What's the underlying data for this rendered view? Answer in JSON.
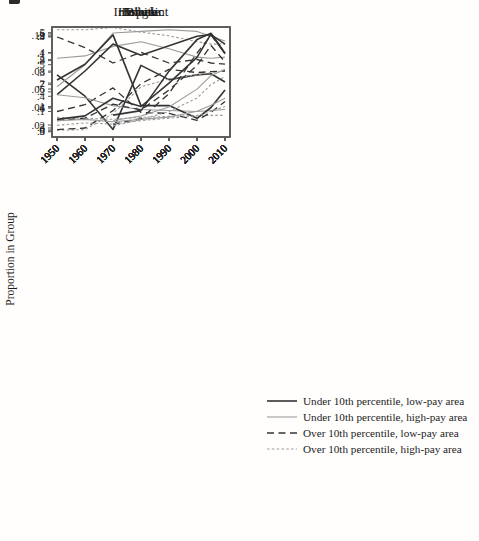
{
  "figure": {
    "ylabel": "Proportion in Group",
    "colors": {
      "dark": "#343434",
      "gray": "#9b9b9b",
      "axis": "#5a5a5a",
      "text": "#1c1c1c",
      "background": "#ffffff"
    },
    "line_styles": {
      "dark-solid": {
        "color": "dark",
        "width": 1.6,
        "dash": ""
      },
      "gray-solid": {
        "color": "gray",
        "width": 1.1,
        "dash": ""
      },
      "dark-dash": {
        "color": "dark",
        "width": 1.3,
        "dash": "7 4.5"
      },
      "gray-dash": {
        "color": "gray",
        "width": 1.1,
        "dash": "2.6 2.2"
      }
    }
  },
  "legend": {
    "items": [
      {
        "label": "Under 10th percentile, low-pay area",
        "style": "dark-solid"
      },
      {
        "label": "Under 10th percentile, high-pay area",
        "style": "gray-solid"
      },
      {
        "label": "Over 10th percentile, low-pay area",
        "style": "dark-dash"
      },
      {
        "label": "Over 10th percentile, high-pay area",
        "style": "gray-dash"
      }
    ]
  },
  "chart_data": [
    {
      "type": "line",
      "title": "White",
      "x": [
        1950,
        1960,
        1970,
        1980,
        1990,
        2000,
        2005,
        2010
      ],
      "xticks": [
        1950,
        1960,
        1970,
        1980,
        1990,
        2000,
        2010
      ],
      "ylim": [
        0.478,
        0.942
      ],
      "yticks": [
        0.5,
        0.6,
        0.7,
        0.8,
        0.9
      ],
      "ytick_labels": [
        ".5",
        ".6",
        ".7",
        ".8",
        ".9"
      ],
      "series": [
        {
          "name": "Under 10th percentile, low-pay area",
          "style": "dark-solid",
          "values": [
            0.74,
            0.65,
            0.51,
            0.78,
            0.72,
            0.74,
            0.745,
            0.71
          ]
        },
        {
          "name": "Under 10th percentile, high-pay area",
          "style": "gray-solid",
          "values": [
            0.81,
            0.82,
            0.86,
            0.88,
            0.85,
            0.815,
            0.81,
            0.815
          ]
        },
        {
          "name": "Over 10th percentile, low-pay area",
          "style": "dark-dash",
          "values": [
            0.9,
            0.855,
            0.79,
            0.835,
            0.79,
            0.805,
            0.79,
            0.785
          ]
        },
        {
          "name": "Over 10th percentile, high-pay area",
          "style": "gray-dash",
          "values": [
            0.93,
            0.93,
            0.94,
            0.92,
            0.905,
            0.88,
            0.87,
            0.87
          ]
        }
      ]
    },
    {
      "type": "line",
      "title": "Female",
      "x": [
        1950,
        1960,
        1970,
        1980,
        1990,
        2000,
        2005,
        2010
      ],
      "xticks": [
        1950,
        1960,
        1970,
        1980,
        1990,
        2000,
        2010
      ],
      "ylim": [
        0.2715,
        0.619
      ],
      "yticks": [
        0.3,
        0.4,
        0.5,
        0.6
      ],
      "ytick_labels": [
        ".3",
        ".4",
        ".5",
        ".6"
      ],
      "series": [
        {
          "name": "Under 10th percentile, low-pay area",
          "style": "dark-solid",
          "values": [
            0.405,
            0.48,
            0.565,
            0.53,
            0.56,
            0.59,
            0.595,
            0.565
          ]
        },
        {
          "name": "Under 10th percentile, high-pay area",
          "style": "gray-solid",
          "values": [
            0.43,
            0.5,
            0.6,
            0.605,
            0.61,
            0.605,
            0.59,
            0.575
          ]
        },
        {
          "name": "Over 10th percentile, low-pay area",
          "style": "dark-dash",
          "values": [
            0.295,
            0.3,
            0.355,
            0.44,
            0.485,
            0.475,
            0.478,
            0.48
          ]
        },
        {
          "name": "Over 10th percentile, high-pay area",
          "style": "gray-dash",
          "values": [
            0.293,
            0.295,
            0.345,
            0.43,
            0.455,
            0.468,
            0.475,
            0.48
          ]
        }
      ]
    },
    {
      "type": "line",
      "title": "Black",
      "x": [
        1950,
        1960,
        1970,
        1980,
        1990,
        2000,
        2005,
        2010
      ],
      "xticks": [
        1950,
        1960,
        1970,
        1980,
        1990,
        2000,
        2010
      ],
      "ylim": [
        -0.03,
        0.53
      ],
      "yticks": [
        0,
        0.1,
        0.2,
        0.3,
        0.4,
        0.5
      ],
      "ytick_labels": [
        "0",
        ".1",
        ".2",
        ".3",
        ".4",
        ".5"
      ],
      "series": [
        {
          "name": "Under 10th percentile, low-pay area",
          "style": "dark-solid",
          "values": [
            0.26,
            0.34,
            0.49,
            0.13,
            0.13,
            0.065,
            0.12,
            0.21
          ]
        },
        {
          "name": "Under 10th percentile, high-pay area",
          "style": "gray-solid",
          "values": [
            0.185,
            0.17,
            0.13,
            0.11,
            0.105,
            0.1,
            0.105,
            0.11
          ]
        },
        {
          "name": "Over 10th percentile, low-pay area",
          "style": "dark-dash",
          "values": [
            0.1,
            0.135,
            0.22,
            0.095,
            0.09,
            0.055,
            0.095,
            0.15
          ]
        },
        {
          "name": "Over 10th percentile, high-pay area",
          "style": "gray-dash",
          "values": [
            0.07,
            0.065,
            0.06,
            0.07,
            0.075,
            0.08,
            0.08,
            0.08
          ]
        }
      ]
    },
    {
      "type": "line",
      "title": "Immigrant",
      "x": [
        1950,
        1960,
        1970,
        1980,
        1990,
        2000,
        2005,
        2010
      ],
      "xticks": [
        1950,
        1960,
        1970,
        1980,
        1990,
        2000,
        2010
      ],
      "ylim": [
        0.0067,
        0.129
      ],
      "yticks": [
        0.02,
        0.04,
        0.06,
        0.08,
        0.1,
        0.12
      ],
      "ytick_labels": [
        ".02",
        ".04",
        ".06",
        ".08",
        ".1",
        ".12"
      ],
      "series": [
        {
          "name": "Under 10th percentile, low-pay area",
          "style": "dark-solid",
          "values": [
            null,
            null,
            0.031,
            0.036,
            0.08,
            0.115,
            0.122,
            0.1
          ]
        },
        {
          "name": "Under 10th percentile, high-pay area",
          "style": "gray-solid",
          "values": [
            null,
            null,
            0.025,
            0.03,
            0.04,
            0.06,
            0.075,
            0.082
          ]
        },
        {
          "name": "Over 10th percentile, low-pay area",
          "style": "dark-dash",
          "values": [
            null,
            null,
            0.021,
            0.027,
            0.055,
            0.1,
            0.12,
            0.1
          ]
        },
        {
          "name": "Over 10th percentile, high-pay area",
          "style": "gray-dash",
          "values": [
            null,
            null,
            0.019,
            0.026,
            0.035,
            0.05,
            0.065,
            0.074
          ]
        }
      ]
    },
    {
      "type": "line",
      "title": "Hispanic",
      "x": [
        1950,
        1960,
        1970,
        1980,
        1990,
        2000,
        2005,
        2010
      ],
      "xticks": [
        1950,
        1960,
        1970,
        1980,
        1990,
        2000,
        2010
      ],
      "ylim": [
        -0.03,
        0.439
      ],
      "yticks": [
        0,
        0.1,
        0.2,
        0.3,
        0.4
      ],
      "ytick_labels": [
        "0",
        ".1",
        ".2",
        ".3",
        ".4"
      ],
      "series": [
        {
          "name": "Under 10th percentile, low-pay area",
          "style": "dark-solid",
          "values": [
            0.045,
            0.06,
            0.135,
            0.1,
            0.2,
            0.31,
            0.41,
            0.325
          ]
        },
        {
          "name": "Under 10th percentile, high-pay area",
          "style": "gray-solid",
          "values": [
            0.04,
            0.045,
            0.035,
            0.045,
            0.055,
            0.08,
            0.105,
            0.135
          ]
        },
        {
          "name": "Over 10th percentile, low-pay area",
          "style": "dark-dash",
          "values": [
            0.04,
            0.05,
            0.11,
            0.085,
            0.17,
            0.275,
            0.36,
            0.29
          ]
        },
        {
          "name": "Over 10th percentile, high-pay area",
          "style": "gray-dash",
          "values": [
            0.02,
            0.03,
            0.025,
            0.04,
            0.05,
            0.06,
            0.08,
            0.1
          ]
        }
      ]
    }
  ]
}
